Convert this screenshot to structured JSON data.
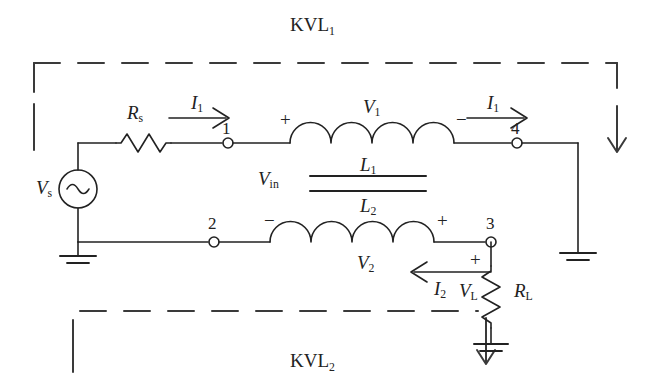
{
  "figure": {
    "type": "circuit-schematic",
    "title_top": "KVL"
  },
  "loops": {
    "top": {
      "label": "KVL",
      "subscript": "1"
    },
    "bottom": {
      "label": "KVL",
      "subscript": "2"
    }
  },
  "components": {
    "source": {
      "label": "V",
      "subscript": "s",
      "kind": "ac-source"
    },
    "series_resistor": {
      "label": "R",
      "subscript": "s",
      "kind": "resistor"
    },
    "primary_inductor": {
      "label": "L",
      "subscript": "1",
      "kind": "inductor"
    },
    "secondary_inductor": {
      "label": "L",
      "subscript": "2",
      "kind": "inductor"
    },
    "load_resistor": {
      "label": "R",
      "subscript": "L",
      "kind": "resistor"
    },
    "core": {
      "kind": "transformer-core",
      "lines": 2
    }
  },
  "voltages": {
    "input": {
      "label": "V",
      "subscript": "in"
    },
    "primary": {
      "label": "V",
      "subscript": "1"
    },
    "secondary": {
      "label": "V",
      "subscript": "2"
    },
    "load": {
      "label": "V",
      "subscript": "L"
    }
  },
  "currents": {
    "i1_left": {
      "label": "I",
      "subscript": "1",
      "direction": "right"
    },
    "i1_right": {
      "label": "I",
      "subscript": "1",
      "direction": "right"
    },
    "i2": {
      "label": "I",
      "subscript": "2",
      "direction": "left"
    }
  },
  "nodes": [
    {
      "id": "1",
      "label": "1"
    },
    {
      "id": "2",
      "label": "2"
    },
    {
      "id": "3",
      "label": "3"
    },
    {
      "id": "4",
      "label": "4"
    }
  ],
  "polarities": {
    "l1_left": "+",
    "l1_right": "−",
    "l2_left": "−",
    "l2_right": "+",
    "load_top": "+"
  },
  "colors": {
    "ink": "#222222",
    "background": "#ffffff",
    "dash": "#3a3a3a"
  }
}
